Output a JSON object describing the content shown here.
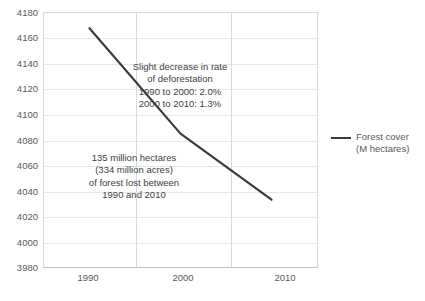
{
  "chart_data": {
    "type": "line",
    "title": "",
    "xlabel": "",
    "ylabel": "",
    "x": [
      1990,
      2000,
      2010
    ],
    "categories": [
      "1990",
      "2000",
      "2010"
    ],
    "series": [
      {
        "name": "Forest cover (M hectares)",
        "values": [
          4168,
          4085,
          4033
        ],
        "color": "#3b3b3b"
      }
    ],
    "ylim": [
      3980,
      4180
    ],
    "ytick_step": 20,
    "xlim": [
      1985,
      2015
    ],
    "yticks": [
      "4180",
      "4160",
      "4140",
      "4120",
      "4100",
      "4080",
      "4060",
      "4040",
      "4020",
      "4000",
      "3980"
    ],
    "ytick_values": [
      4180,
      4160,
      4140,
      4120,
      4100,
      4080,
      4060,
      4040,
      4020,
      4000,
      3980
    ],
    "xticks": [
      "1990",
      "2000",
      "2010"
    ],
    "xtick_values": [
      1990,
      2000,
      2010
    ],
    "grid": {
      "horizontal": true,
      "vertical": true
    },
    "legend": {
      "position": "right",
      "entries": [
        {
          "label_line1": "Forest cover",
          "label_line2": "(M hectares)",
          "color": "#3b3b3b"
        }
      ]
    },
    "annotations": [
      {
        "id": "deforestation-rate-note",
        "lines": [
          "Slight decrease in rate",
          "of deforestation",
          "1990 to 2000: 2.0%",
          "2000 to 2010: 1.3%"
        ]
      },
      {
        "id": "forest-loss-note",
        "lines": [
          "135 million hectares",
          "(334 million acres)",
          "of forest lost between",
          "1990 and 2010"
        ]
      }
    ]
  }
}
